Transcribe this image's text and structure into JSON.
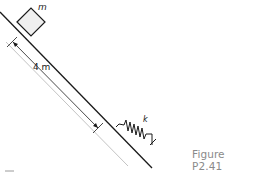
{
  "figure": {
    "caption": "Figure P2.41",
    "labels": {
      "mass": "m",
      "distance": "4 m",
      "spring": "k"
    },
    "colors": {
      "stroke": "#1a1a1a",
      "incline_shade_light": "#f4f4f4",
      "incline_shade_dark": "#bdbdbd",
      "caption": "#8a8a8a"
    }
  }
}
